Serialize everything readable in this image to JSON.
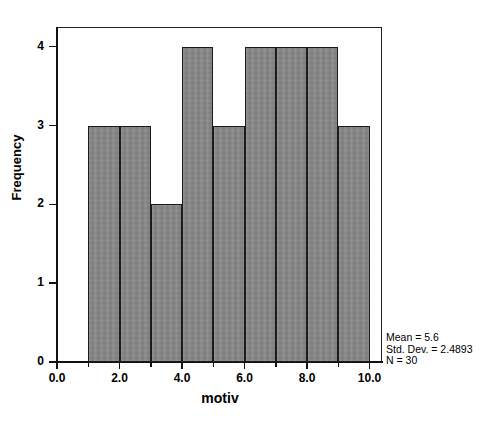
{
  "chart_data": {
    "type": "bar",
    "title": "",
    "xlabel": "motiv",
    "ylabel": "Frequency",
    "xlim": [
      0,
      10.4
    ],
    "ylim": [
      0,
      4.25
    ],
    "grid": false,
    "legend": null,
    "bin_width": 1,
    "categories": [
      "1-2",
      "2-3",
      "3-4",
      "4-5",
      "5-6",
      "6-7",
      "7-8",
      "8-9",
      "9-10"
    ],
    "bin_edges": [
      1,
      2,
      3,
      4,
      5,
      6,
      7,
      8,
      9,
      10
    ],
    "values": [
      3,
      3,
      2,
      4,
      3,
      4,
      4,
      4,
      3
    ],
    "xticks": [
      0,
      2,
      4,
      6,
      8,
      10
    ],
    "xticklabels": [
      "0.0",
      "2.0",
      "4.0",
      "6.0",
      "8.0",
      "10.0"
    ],
    "yticks": [
      0,
      1,
      2,
      3,
      4
    ],
    "yticklabels": [
      "0",
      "1",
      "2",
      "3",
      "4"
    ],
    "bar_fill_color": "#868686",
    "bar_edge_color": "#1b1b1b",
    "annotations": {
      "mean_label": "Mean = 5.6",
      "std_dev_label": "Std. Dev. = 2.4893",
      "n_label": "N = 30"
    }
  }
}
